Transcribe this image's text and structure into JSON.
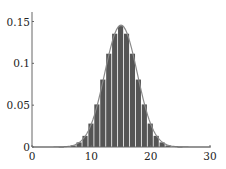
{
  "chart_data": {
    "type": "bar",
    "title": "",
    "xlabel": "",
    "ylabel": "",
    "xlim": [
      0,
      30
    ],
    "ylim": [
      0,
      0.16
    ],
    "grid": false,
    "legend": null,
    "x_ticks": [
      0,
      10,
      20,
      30
    ],
    "x_tick_labels": [
      "0",
      "10",
      "20",
      "30"
    ],
    "y_ticks": [
      0,
      0.05,
      0.1,
      0.15
    ],
    "y_tick_labels": [
      "0",
      "0.05",
      "0.1",
      "0.15"
    ],
    "categories": [
      0,
      1,
      2,
      3,
      4,
      5,
      6,
      7,
      8,
      9,
      10,
      11,
      12,
      13,
      14,
      15,
      16,
      17,
      18,
      19,
      20,
      21,
      22,
      23,
      24,
      25,
      26,
      27,
      28,
      29,
      30
    ],
    "series": [
      {
        "name": "histogram",
        "kind": "bar",
        "color": "#555555",
        "values": [
          0,
          0,
          0,
          0,
          0,
          0.0001,
          0.0006,
          0.0019,
          0.0055,
          0.0133,
          0.028,
          0.0509,
          0.0806,
          0.1115,
          0.1354,
          0.1445,
          0.1354,
          0.1115,
          0.0806,
          0.0509,
          0.028,
          0.0133,
          0.0055,
          0.0019,
          0.0006,
          0.0001,
          0,
          0,
          0,
          0,
          0
        ]
      },
      {
        "name": "normal-fit",
        "kind": "line",
        "color": "#888888",
        "mean": 15,
        "sd": 2.739
      }
    ]
  }
}
